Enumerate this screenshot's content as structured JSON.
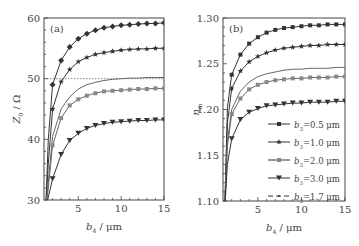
{
  "figure": {
    "panels": [
      {
        "id": "a",
        "label": "(a)",
        "ylabel_main": "Z",
        "ylabel_sub": "0",
        "ylabel_unit": "/ Ω",
        "xlabel_main": "b",
        "xlabel_sub": "4",
        "xlabel_unit": "/ μm",
        "xticks": [
          "5",
          "10",
          "15"
        ],
        "yticks": [
          "30",
          "40",
          "50",
          "60"
        ],
        "reference_line": "50"
      },
      {
        "id": "b",
        "label": "(b)",
        "ylabel_main": "n",
        "ylabel_sub": "m",
        "xlabel_main": "b",
        "xlabel_sub": "4",
        "xlabel_unit": "/ μm",
        "xticks": [
          "5",
          "10",
          "15"
        ],
        "yticks": [
          "1.10",
          "1.15",
          "1.20",
          "1.25",
          "1.30"
        ]
      }
    ],
    "legend": [
      {
        "marker": "square",
        "label_main": "b",
        "label_sub": "3",
        "label_rest": "=0.5 μm"
      },
      {
        "marker": "star",
        "label_main": "b",
        "label_sub": "3",
        "label_rest": "=1.0 μm"
      },
      {
        "marker": "square-light",
        "label_main": "b",
        "label_sub": "3",
        "label_rest": "=2.0 μm"
      },
      {
        "marker": "triangle-down",
        "label_main": "b",
        "label_sub": "3",
        "label_rest": "=3.0 μm"
      },
      {
        "marker": "dot",
        "label_main": "b",
        "label_sub": "3",
        "label_rest": "=1.7 μm"
      }
    ]
  },
  "chart_data": [
    {
      "type": "line",
      "title": "(a)",
      "xlabel": "b4 / μm",
      "ylabel": "Z0 / Ω",
      "xlim": [
        1,
        15
      ],
      "ylim": [
        30,
        60
      ],
      "grid": false,
      "reference_line": {
        "y": 50,
        "style": "dotted"
      },
      "x": [
        1.5,
        2,
        3,
        4,
        5,
        6,
        7,
        8,
        9,
        10,
        11,
        12,
        13,
        14,
        15
      ],
      "series": [
        {
          "name": "b3=0.5 μm",
          "marker": "diamond",
          "values": [
            40.0,
            49.0,
            53.0,
            55.2,
            56.6,
            57.4,
            58.0,
            58.4,
            58.6,
            58.8,
            58.9,
            59.0,
            59.1,
            59.1,
            59.2
          ]
        },
        {
          "name": "b3=1.0 μm",
          "marker": "star",
          "values": [
            36.0,
            45.0,
            49.5,
            51.5,
            52.8,
            53.5,
            54.0,
            54.3,
            54.5,
            54.7,
            54.8,
            54.9,
            54.9,
            55.0,
            55.0
          ]
        },
        {
          "name": "b3=1.7 μm",
          "marker": "none",
          "values": [
            33.0,
            40.5,
            45.0,
            47.0,
            48.3,
            49.0,
            49.4,
            49.7,
            49.9,
            50.0,
            50.1,
            50.1,
            50.2,
            50.2,
            50.2
          ]
        },
        {
          "name": "b3=2.0 μm",
          "marker": "square",
          "values": [
            32.0,
            39.0,
            43.5,
            45.6,
            46.6,
            47.2,
            47.6,
            47.9,
            48.0,
            48.1,
            48.2,
            48.3,
            48.3,
            48.4,
            48.4
          ]
        },
        {
          "name": "b3=3.0 μm",
          "marker": "triangle-down",
          "values": [
            30.5,
            33.5,
            37.5,
            39.8,
            41.0,
            41.8,
            42.3,
            42.6,
            42.8,
            42.9,
            43.0,
            43.1,
            43.1,
            43.2,
            43.2
          ]
        }
      ]
    },
    {
      "type": "line",
      "title": "(b)",
      "xlabel": "b4 / μm",
      "ylabel": "n_m",
      "xlim": [
        1,
        15
      ],
      "ylim": [
        1.1,
        1.3
      ],
      "grid": false,
      "legend_position": "lower right",
      "x": [
        1.5,
        2,
        3,
        4,
        5,
        6,
        7,
        8,
        9,
        10,
        11,
        12,
        13,
        14,
        15
      ],
      "series": [
        {
          "name": "b3=0.5 μm",
          "marker": "square",
          "values": [
            1.202,
            1.238,
            1.26,
            1.272,
            1.279,
            1.284,
            1.287,
            1.289,
            1.29,
            1.291,
            1.292,
            1.292,
            1.293,
            1.293,
            1.293
          ]
        },
        {
          "name": "b3=1.0 μm",
          "marker": "star",
          "values": [
            1.185,
            1.223,
            1.242,
            1.252,
            1.258,
            1.262,
            1.265,
            1.267,
            1.268,
            1.269,
            1.27,
            1.27,
            1.271,
            1.271,
            1.271
          ]
        },
        {
          "name": "b3=1.7 μm",
          "marker": "none",
          "values": [
            1.165,
            1.2,
            1.22,
            1.23,
            1.236,
            1.239,
            1.241,
            1.243,
            1.244,
            1.244,
            1.245,
            1.245,
            1.245,
            1.246,
            1.246
          ]
        },
        {
          "name": "b3=2.0 μm",
          "marker": "square",
          "values": [
            1.16,
            1.195,
            1.212,
            1.222,
            1.227,
            1.23,
            1.232,
            1.233,
            1.234,
            1.234,
            1.235,
            1.235,
            1.235,
            1.236,
            1.236
          ]
        },
        {
          "name": "b3=3.0 μm",
          "marker": "triangle-down",
          "values": [
            1.14,
            1.168,
            1.189,
            1.197,
            1.201,
            1.204,
            1.205,
            1.206,
            1.207,
            1.207,
            1.208,
            1.208,
            1.208,
            1.209,
            1.209
          ]
        }
      ]
    }
  ]
}
